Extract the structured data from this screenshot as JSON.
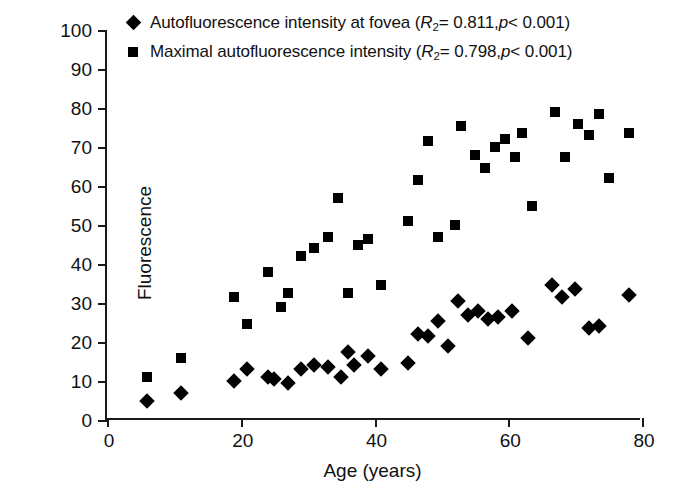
{
  "chart_data": {
    "type": "scatter",
    "title": "",
    "xlabel": "Age (years)",
    "ylabel": "Fluorescence",
    "xlim": [
      0,
      80
    ],
    "ylim": [
      0,
      100
    ],
    "xticks": [
      0,
      20,
      40,
      60,
      80
    ],
    "yticks": [
      0,
      10,
      20,
      30,
      40,
      50,
      60,
      70,
      80,
      90,
      100
    ],
    "grid": false,
    "legend_position": "top-left-outside",
    "series": [
      {
        "name": "Autofluorescence intensity at fovea",
        "marker": "diamond",
        "color": "#000000",
        "r2": "0.811",
        "p": "<0.001",
        "legend_label": "Autofluorescence intensity at fovea (R2 = 0.811, p < 0.001)",
        "points": [
          [
            6,
            5
          ],
          [
            11,
            7
          ],
          [
            19,
            10
          ],
          [
            21,
            13
          ],
          [
            24,
            11
          ],
          [
            25,
            10.5
          ],
          [
            27,
            9.5
          ],
          [
            29,
            13
          ],
          [
            31,
            14
          ],
          [
            33,
            13.5
          ],
          [
            35,
            11
          ],
          [
            36,
            17.5
          ],
          [
            37,
            14
          ],
          [
            39,
            16.5
          ],
          [
            41,
            13
          ],
          [
            45,
            14.5
          ],
          [
            46.5,
            22
          ],
          [
            48,
            21.5
          ],
          [
            49.5,
            25.5
          ],
          [
            51,
            19
          ],
          [
            52.5,
            30.5
          ],
          [
            54,
            27
          ],
          [
            55.5,
            28
          ],
          [
            57,
            26
          ],
          [
            58.5,
            26.5
          ],
          [
            60.5,
            28
          ],
          [
            63,
            21
          ],
          [
            66.5,
            34.5
          ],
          [
            68,
            31.5
          ],
          [
            70,
            33.5
          ],
          [
            72,
            23.5
          ],
          [
            73.5,
            24
          ],
          [
            78,
            32
          ]
        ]
      },
      {
        "name": "Maximal autofluorescence intensity",
        "marker": "square",
        "color": "#000000",
        "r2": "0.798",
        "p": "<0.001",
        "legend_label": "Maximal autofluorescence intensity (R2 = 0.798, p < 0.001)",
        "points": [
          [
            6,
            11
          ],
          [
            11,
            16
          ],
          [
            19,
            31.5
          ],
          [
            21,
            24.5
          ],
          [
            24,
            38
          ],
          [
            26,
            29
          ],
          [
            27,
            32.5
          ],
          [
            29,
            42
          ],
          [
            31,
            44
          ],
          [
            33,
            47
          ],
          [
            34.5,
            57
          ],
          [
            36,
            32.5
          ],
          [
            37.5,
            45
          ],
          [
            39,
            46.5
          ],
          [
            41,
            34.5
          ],
          [
            45,
            51
          ],
          [
            46.5,
            61.5
          ],
          [
            48,
            71.5
          ],
          [
            49.5,
            47
          ],
          [
            52,
            50
          ],
          [
            53,
            75.5
          ],
          [
            55,
            68
          ],
          [
            56.5,
            64.5
          ],
          [
            58,
            70
          ],
          [
            59.5,
            72
          ],
          [
            61,
            67.5
          ],
          [
            62,
            73.5
          ],
          [
            63.5,
            55
          ],
          [
            67,
            79
          ],
          [
            68.5,
            67.5
          ],
          [
            70.5,
            76
          ],
          [
            72,
            73
          ],
          [
            73.5,
            78.5
          ],
          [
            75,
            62
          ],
          [
            78,
            73.5
          ]
        ]
      }
    ]
  },
  "axis": {
    "y_title": "Fluorescence",
    "x_title": "Age (years)"
  },
  "legend": {
    "items": [
      {
        "marker": "diamond",
        "prefix": "Autofluorescence intensity at fovea (",
        "r_symbol": "R",
        "r_sub": "2",
        "eq": " = 0.811, ",
        "p_symbol": "p",
        "p_value": " < 0.001)"
      },
      {
        "marker": "square",
        "prefix": "Maximal autofluorescence intensity (",
        "r_symbol": "R",
        "r_sub": "2",
        "eq": " = 0.798, ",
        "p_symbol": "p",
        "p_value": " < 0.001)"
      }
    ]
  }
}
